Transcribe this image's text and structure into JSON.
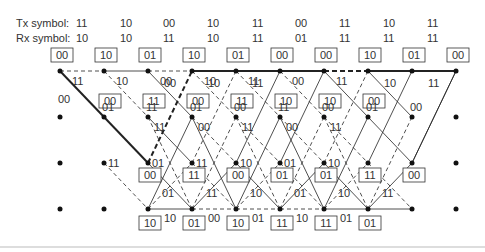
{
  "header": {
    "tx_label": "Tx symbol:",
    "rx_label": "Rx symbol:",
    "tx_symbols": [
      "11",
      "10",
      "00",
      "10",
      "11",
      "00",
      "11",
      "10",
      "11"
    ],
    "rx_symbols": [
      "10",
      "10",
      "11",
      "10",
      "11",
      "01",
      "11",
      "11",
      "11"
    ]
  },
  "trellis": {
    "states": [
      "00",
      "01",
      "10",
      "11"
    ],
    "row0_metrics": [
      "00",
      "10",
      "01",
      "10",
      "01",
      "00",
      "00",
      "10",
      "01",
      "00"
    ],
    "row1_metrics": [
      "",
      "00",
      "11",
      "00",
      "11",
      "10",
      "10",
      "00",
      "",
      ""
    ],
    "row2_metrics": [
      "",
      "",
      "00",
      "11",
      "00",
      "01",
      "01",
      "11",
      "00",
      ""
    ],
    "row3_metrics": [
      "",
      "",
      "10",
      "01",
      "10",
      "11",
      "11",
      "01",
      "",
      ""
    ],
    "branch_labels": {
      "row0_horizontal": [
        "",
        "",
        "00",
        "10",
        "11",
        "",
        "",
        "10",
        "11"
      ],
      "row0_down": [
        "11",
        "10",
        "00",
        "10",
        "11",
        "00",
        "11",
        "",
        ""
      ],
      "row1_up": [
        "00",
        "01",
        "11",
        "01",
        "00",
        "11",
        "00",
        "01",
        "00"
      ],
      "row1_down": [
        "",
        "",
        "11",
        "00",
        "11",
        "00",
        "11",
        "",
        ""
      ],
      "row2_label_right": [
        "",
        "11",
        "01",
        "11",
        "10",
        "01",
        "10",
        "",
        ""
      ],
      "row3_horizontal": [
        "",
        "",
        "10",
        "00",
        "01",
        "10",
        "01",
        "",
        ""
      ],
      "row3_up": [
        "",
        "",
        "01",
        "11",
        "10",
        "01",
        "10",
        "11",
        ""
      ]
    }
  }
}
